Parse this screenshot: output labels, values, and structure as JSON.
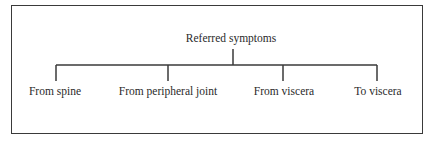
{
  "diagram": {
    "type": "tree",
    "root": {
      "label": "Referred symptoms"
    },
    "children": [
      {
        "label": "From spine"
      },
      {
        "label": "From peripheral joint"
      },
      {
        "label": "From viscera"
      },
      {
        "label": "To viscera"
      }
    ],
    "colors": {
      "line": "#3a3a3a",
      "text": "#2a2a2a",
      "background": "#ffffff"
    }
  }
}
